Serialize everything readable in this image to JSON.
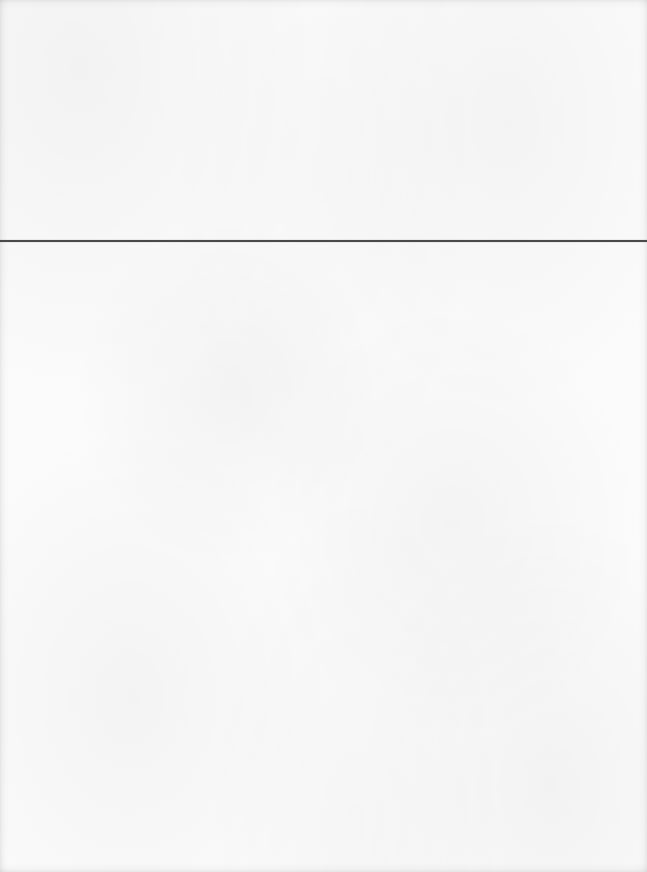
{
  "page": {
    "background_color": "#fbfbfb",
    "rule_color": "#4a4a4a",
    "content_above_rule": "",
    "content_below_rule": ""
  }
}
